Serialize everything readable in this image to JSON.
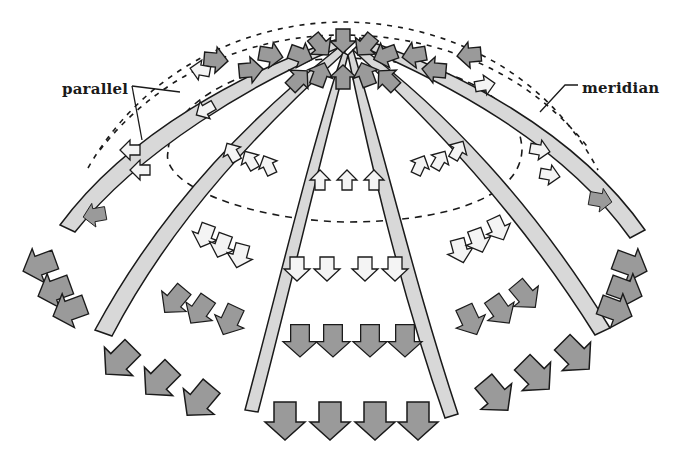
{
  "diagram": {
    "labels": {
      "parallel": "parallel",
      "meridian": "meridian"
    },
    "colors": {
      "background": "#ffffff",
      "outline": "#1a1a1a",
      "meridian_band": "#d6d6d6",
      "compression_arrow": "#9a9a9a",
      "tension_arrow": "#f2f2f2",
      "dashed_parallel": "#1a1a1a"
    },
    "legend_semantics": {
      "dark_arrows": "compression",
      "light_arrows": "tension"
    },
    "zones": [
      {
        "name": "crown",
        "arrow_style": "dark",
        "direction": "inward toward apex"
      },
      {
        "name": "upper ring",
        "arrow_style": "light",
        "direction": "up along meridian"
      },
      {
        "name": "lower ring",
        "arrow_style": "light",
        "direction": "down along meridian"
      },
      {
        "name": "base",
        "arrow_style": "dark",
        "direction": "downward outward"
      }
    ]
  }
}
